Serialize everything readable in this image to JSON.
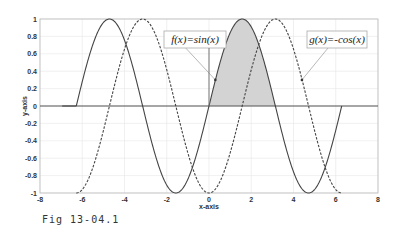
{
  "chart_data": {
    "type": "line",
    "title": "",
    "xlabel": "x-axis",
    "ylabel": "y-axis",
    "xlim": [
      -8,
      8
    ],
    "ylim": [
      -1,
      1
    ],
    "grid": true,
    "xticks": [
      -8,
      -6,
      -4,
      -2,
      0,
      2,
      4,
      6,
      8
    ],
    "xtick_labels": [
      "-8",
      "-6",
      "-4",
      "-2",
      "0",
      "2",
      "4",
      "6",
      "8"
    ],
    "yticks": [
      -1,
      -0.8,
      -0.6,
      -0.4,
      -0.2,
      0,
      0.2,
      0.4,
      0.6,
      0.8,
      1
    ],
    "ytick_labels": [
      "-1",
      "-0.8",
      "-0.6",
      "-0.4",
      "-0.2",
      "0",
      "0.2",
      "0.4",
      "0.6",
      "0.8",
      "1"
    ],
    "series": [
      {
        "name": "f(x)=sin(x)",
        "function": "sin",
        "x_range": [
          -6.2832,
          6.2832
        ],
        "style": "solid",
        "color": "#444444"
      },
      {
        "name": "g(x)=-cos(x)",
        "function": "-cos",
        "x_range": [
          -6.2832,
          6.2832
        ],
        "style": "dashed",
        "color": "#444444"
      }
    ],
    "shaded_region": {
      "series": "f(x)=sin(x)",
      "x_range": [
        0,
        3.1416
      ],
      "color": "#d3d3d3"
    },
    "annotations": [
      {
        "text": "f(x)=sin(x)",
        "points_to": {
          "x": 0.3,
          "y": 0.3
        }
      },
      {
        "text": "g(x)=-cos(x)",
        "points_to": {
          "x": 4.4,
          "y": 0.3
        }
      }
    ]
  },
  "caption": "Fig 13-04.1"
}
